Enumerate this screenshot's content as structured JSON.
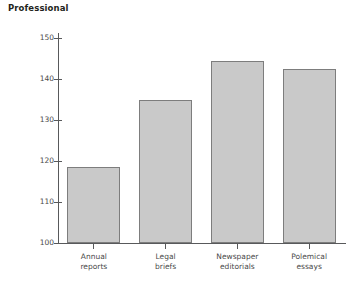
{
  "chart_data": {
    "type": "bar",
    "title": "Professional",
    "xlabel": "",
    "ylabel": "",
    "categories": [
      "Annual reports",
      "Legal briefs",
      "Newspaper editorials",
      "Polemical essays"
    ],
    "category_lines": [
      [
        "Annual",
        "reports"
      ],
      [
        "Legal",
        "briefs"
      ],
      [
        "Newspaper",
        "editorials"
      ],
      [
        "Polemical",
        "essays"
      ]
    ],
    "values": [
      118.5,
      134.8,
      144.5,
      142.5
    ],
    "ylim": [
      100,
      150
    ],
    "yticks": [
      100,
      110,
      120,
      130,
      140,
      150
    ],
    "ytick_labels": [
      "100",
      "110",
      "120",
      "130",
      "140",
      "150"
    ],
    "grid": false,
    "legend": false,
    "bar_fill_color": "#c9c9c9",
    "bar_edge_color": "#7d7d7d",
    "axis_color": "#58595b",
    "text_color": "#4a4a4a",
    "title_color": "#231f20",
    "background_color": "#ffffff"
  }
}
